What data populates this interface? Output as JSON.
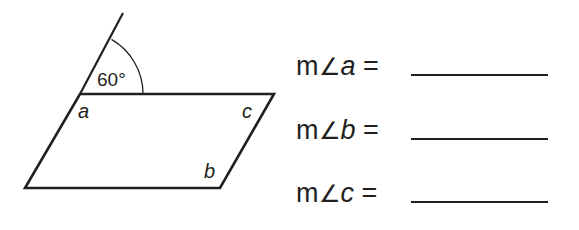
{
  "figure": {
    "angle_label": "60°",
    "vertex_labels": {
      "a": "a",
      "b": "b",
      "c": "c"
    },
    "parallelogram": {
      "top_left": [
        80,
        94
      ],
      "top_right": [
        274,
        94
      ],
      "bottom_right": [
        220,
        188
      ],
      "bottom_left": [
        25,
        188
      ]
    },
    "extended_line_end": [
      123,
      13
    ],
    "stroke_color": "#231f20"
  },
  "questions": [
    {
      "prefix": "m",
      "angle_symbol": "∠",
      "variable": "a",
      "equals": "=",
      "answer": ""
    },
    {
      "prefix": "m",
      "angle_symbol": "∠",
      "variable": "b",
      "equals": "=",
      "answer": ""
    },
    {
      "prefix": "m",
      "angle_symbol": "∠",
      "variable": "c",
      "equals": "=",
      "answer": ""
    }
  ]
}
